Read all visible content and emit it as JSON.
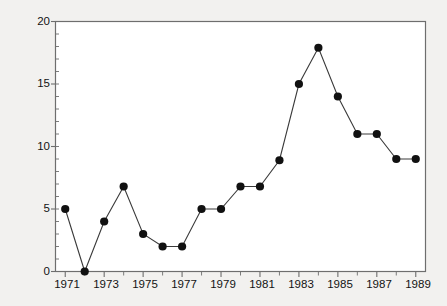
{
  "chart_data": {
    "type": "line",
    "title": "",
    "subtitle": "",
    "xlabel": "",
    "ylabel": "PG premium (pence per lb)",
    "xlim": [
      1970.5,
      1989.5
    ],
    "ylim": [
      0,
      20
    ],
    "grid": false,
    "legend": null,
    "marker": "filled-circle",
    "line_color": "#3a3a3a",
    "marker_color": "#111111",
    "x": [
      1971,
      1972,
      1973,
      1974,
      1975,
      1976,
      1977,
      1978,
      1979,
      1980,
      1981,
      1982,
      1983,
      1984,
      1985,
      1986,
      1987,
      1988,
      1989
    ],
    "values": [
      5,
      0,
      4,
      6.8,
      3,
      2,
      2,
      5,
      5,
      6.8,
      6.8,
      8.9,
      15,
      17.9,
      14,
      11,
      11,
      9,
      9
    ],
    "series": [
      {
        "name": "PG premium",
        "values": [
          5,
          0,
          4,
          6.8,
          3,
          2,
          2,
          5,
          5,
          6.8,
          6.8,
          8.9,
          15,
          17.9,
          14,
          11,
          11,
          9,
          9
        ]
      }
    ],
    "y_tick_values": [
      0,
      5,
      10,
      15,
      20
    ],
    "y_tick_labels": [
      "0",
      "5",
      "10",
      "15",
      "20"
    ],
    "y_minor_tick_step": 1,
    "x_tick_values": [
      1971,
      1972,
      1973,
      1974,
      1975,
      1976,
      1977,
      1978,
      1979,
      1980,
      1981,
      1982,
      1983,
      1984,
      1985,
      1986,
      1987,
      1988,
      1989
    ],
    "x_tick_labels": [
      "1971",
      "",
      "1973",
      "",
      "1975",
      "",
      "1977",
      "",
      "1979",
      "",
      "1981",
      "",
      "1983",
      "",
      "1985",
      "",
      "1987",
      "",
      "1989"
    ],
    "x_labeled_values": [
      1971,
      1973,
      1975,
      1977,
      1979,
      1981,
      1983,
      1985,
      1987,
      1989
    ],
    "x_labeled_text": [
      "1971",
      "1973",
      "1975",
      "1977",
      "1979",
      "1981",
      "1983",
      "1985",
      "1987",
      "1989"
    ],
    "axes": {
      "frame": "full-box",
      "frame_color": "#6e6e6e",
      "background": "#ffffff"
    }
  },
  "page": {
    "background_color": "#f2f1ef"
  }
}
